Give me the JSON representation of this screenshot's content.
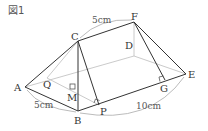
{
  "figure": {
    "title": "図1",
    "points": {
      "A": {
        "label": "A",
        "x": 25,
        "y": 87
      },
      "B": {
        "label": "B",
        "x": 78,
        "y": 111
      },
      "C": {
        "label": "C",
        "x": 78,
        "y": 41
      },
      "D": {
        "label": "D",
        "x": 134,
        "y": 56
      },
      "E": {
        "label": "E",
        "x": 186,
        "y": 74
      },
      "F": {
        "label": "F",
        "x": 134,
        "y": 22
      },
      "G": {
        "label": "G",
        "x": 165,
        "y": 80
      },
      "P": {
        "label": "P",
        "x": 99,
        "y": 105
      },
      "Q": {
        "label": "Q",
        "x": 47,
        "y": 78
      },
      "M": {
        "label": "M",
        "x": 78,
        "y": 91
      }
    },
    "dimensions": {
      "CF": "5cm",
      "AB": "5cm",
      "BE": "10cm"
    },
    "colors": {
      "visible_edge": "#333333",
      "hidden_edge": "#bbbbbb",
      "dimension_arc": "#aaaaaa"
    }
  }
}
